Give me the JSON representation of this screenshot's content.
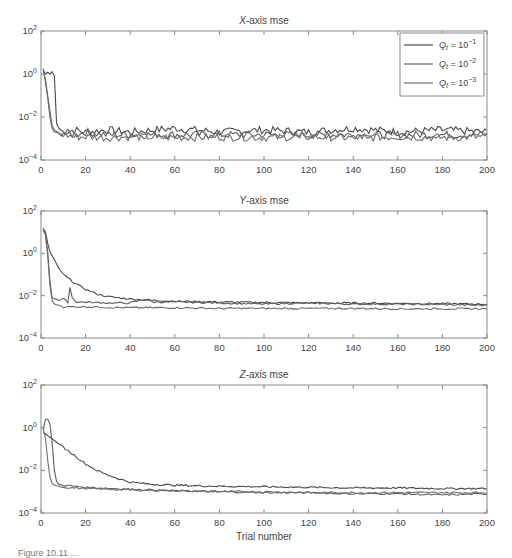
{
  "figure": {
    "caption": "Figure 10.11 ..."
  },
  "legend": {
    "entries": [
      {
        "label_main": "Q",
        "label_sub": "t",
        "label_rest": " = 10",
        "label_exp": "−1",
        "color": "#4a4a4a"
      },
      {
        "label_main": "Q",
        "label_sub": "t",
        "label_rest": " = 10",
        "label_exp": "−2",
        "color": "#5e5e5e"
      },
      {
        "label_main": "Q",
        "label_sub": "t",
        "label_rest": " = 10",
        "label_exp": "−3",
        "color": "#6e6e6e"
      }
    ]
  },
  "chart_data": [
    {
      "type": "line",
      "title": "X-axis mse",
      "title_italic": "X",
      "title_rest": "-axis mse",
      "xlabel": "",
      "ylabel": "",
      "xlim": [
        0,
        200
      ],
      "ylim": [
        0.0001,
        100
      ],
      "yscale": "log",
      "xticks": [
        0,
        20,
        40,
        60,
        80,
        100,
        120,
        140,
        160,
        180,
        200
      ],
      "yticks": [
        "10^-4",
        "10^-2",
        "10^0",
        "10^2"
      ],
      "legend_position": "upper right",
      "grid": false,
      "series": [
        {
          "name": "Q_t = 10^-1",
          "x": [
            1,
            2,
            3,
            4,
            5,
            6,
            7,
            8,
            10,
            15,
            20,
            30,
            40,
            60,
            80,
            100,
            120,
            140,
            160,
            180,
            200
          ],
          "values": [
            1.5,
            1.0,
            1.2,
            1.0,
            1.3,
            0.8,
            0.005,
            0.003,
            0.002,
            0.0025,
            0.002,
            0.0025,
            0.002,
            0.003,
            0.002,
            0.0025,
            0.002,
            0.003,
            0.002,
            0.0025,
            0.002
          ]
        },
        {
          "name": "Q_t = 10^-2",
          "x": [
            1,
            2,
            3,
            4,
            5,
            6,
            8,
            10,
            15,
            20,
            30,
            40,
            60,
            80,
            100,
            120,
            140,
            160,
            180,
            200
          ],
          "values": [
            1.8,
            0.4,
            0.08,
            0.01,
            0.003,
            0.002,
            0.0018,
            0.002,
            0.0015,
            0.002,
            0.0015,
            0.0015,
            0.0015,
            0.0015,
            0.0015,
            0.0015,
            0.0015,
            0.0015,
            0.0015,
            0.0015
          ]
        },
        {
          "name": "Q_t = 10^-3",
          "x": [
            1,
            2,
            3,
            4,
            5,
            6,
            8,
            10,
            15,
            20,
            30,
            40,
            60,
            80,
            100,
            120,
            140,
            160,
            180,
            200
          ],
          "values": [
            1.2,
            0.6,
            0.1,
            0.02,
            0.004,
            0.0025,
            0.0018,
            0.0015,
            0.0012,
            0.0012,
            0.0011,
            0.0012,
            0.0011,
            0.0012,
            0.0011,
            0.0012,
            0.0011,
            0.0012,
            0.0011,
            0.0012
          ]
        }
      ]
    },
    {
      "type": "line",
      "title": "Y-axis mse",
      "title_italic": "Y",
      "title_rest": "-axis mse",
      "xlabel": "",
      "ylabel": "",
      "xlim": [
        0,
        200
      ],
      "ylim": [
        0.0001,
        100
      ],
      "yscale": "log",
      "xticks": [
        0,
        20,
        40,
        60,
        80,
        100,
        120,
        140,
        160,
        180,
        200
      ],
      "yticks": [
        "10^-4",
        "10^-2",
        "10^0",
        "10^2"
      ],
      "grid": false,
      "series": [
        {
          "name": "Q_t = 10^-1",
          "x": [
            1,
            2,
            3,
            4,
            6,
            8,
            10,
            15,
            20,
            25,
            30,
            40,
            50,
            60,
            80,
            100,
            120,
            140,
            160,
            180,
            200
          ],
          "values": [
            15,
            10,
            3,
            1.2,
            0.5,
            0.2,
            0.1,
            0.04,
            0.02,
            0.012,
            0.009,
            0.007,
            0.006,
            0.0055,
            0.005,
            0.0048,
            0.0045,
            0.0045,
            0.0043,
            0.0042,
            0.004
          ]
        },
        {
          "name": "Q_t = 10^-2",
          "x": [
            1,
            2,
            3,
            4,
            5,
            8,
            10,
            12,
            13,
            14,
            16,
            20,
            30,
            40,
            47,
            50,
            60,
            80,
            100,
            120,
            140,
            160,
            180,
            200
          ],
          "values": [
            14,
            8,
            1.2,
            0.05,
            0.008,
            0.006,
            0.007,
            0.005,
            0.025,
            0.008,
            0.005,
            0.005,
            0.0045,
            0.0045,
            0.007,
            0.005,
            0.005,
            0.0045,
            0.004,
            0.0045,
            0.004,
            0.004,
            0.0038,
            0.0035
          ]
        },
        {
          "name": "Q_t = 10^-3",
          "x": [
            1,
            2,
            3,
            4,
            5,
            6,
            8,
            10,
            15,
            20,
            30,
            40,
            60,
            80,
            100,
            120,
            140,
            160,
            180,
            200
          ],
          "values": [
            13,
            7,
            0.8,
            0.03,
            0.006,
            0.004,
            0.0035,
            0.003,
            0.003,
            0.003,
            0.0028,
            0.0027,
            0.0027,
            0.0025,
            0.0025,
            0.0025,
            0.0025,
            0.0024,
            0.0024,
            0.0024
          ]
        }
      ]
    },
    {
      "type": "line",
      "title": "Z-axis mse",
      "title_italic": "Z",
      "title_rest": "-axis mse",
      "xlabel": "Trial number",
      "ylabel": "",
      "xlim": [
        0,
        200
      ],
      "ylim": [
        0.0001,
        100
      ],
      "yscale": "log",
      "xticks": [
        0,
        20,
        40,
        60,
        80,
        100,
        120,
        140,
        160,
        180,
        200
      ],
      "yticks": [
        "10^-4",
        "10^-2",
        "10^0",
        "10^2"
      ],
      "grid": false,
      "series": [
        {
          "name": "Q_t = 10^-1",
          "x": [
            1,
            5,
            10,
            15,
            20,
            25,
            30,
            35,
            40,
            50,
            60,
            80,
            100,
            120,
            140,
            160,
            180,
            200
          ],
          "values": [
            0.6,
            0.3,
            0.12,
            0.05,
            0.02,
            0.01,
            0.006,
            0.004,
            0.0028,
            0.0022,
            0.002,
            0.0018,
            0.0017,
            0.0016,
            0.0015,
            0.0015,
            0.0014,
            0.0014
          ]
        },
        {
          "name": "Q_t = 10^-2",
          "x": [
            1,
            2,
            3,
            4,
            5,
            6,
            7,
            8,
            10,
            20,
            40,
            60,
            80,
            100,
            120,
            140,
            160,
            180,
            200
          ],
          "values": [
            0.8,
            2.5,
            2.5,
            1.5,
            0.2,
            0.01,
            0.003,
            0.0022,
            0.002,
            0.0016,
            0.0013,
            0.0011,
            0.001,
            0.0009,
            0.0009,
            0.0008,
            0.0008,
            0.0007,
            0.0008
          ]
        },
        {
          "name": "Q_t = 10^-3",
          "x": [
            1,
            2,
            3,
            4,
            5,
            6,
            8,
            10,
            20,
            40,
            60,
            80,
            100,
            120,
            140,
            160,
            180,
            200
          ],
          "values": [
            0.9,
            0.3,
            0.03,
            0.005,
            0.0025,
            0.002,
            0.0018,
            0.0016,
            0.0014,
            0.0012,
            0.0011,
            0.001,
            0.001,
            0.0009,
            0.0009,
            0.0009,
            0.0009,
            0.0009
          ]
        }
      ]
    }
  ]
}
